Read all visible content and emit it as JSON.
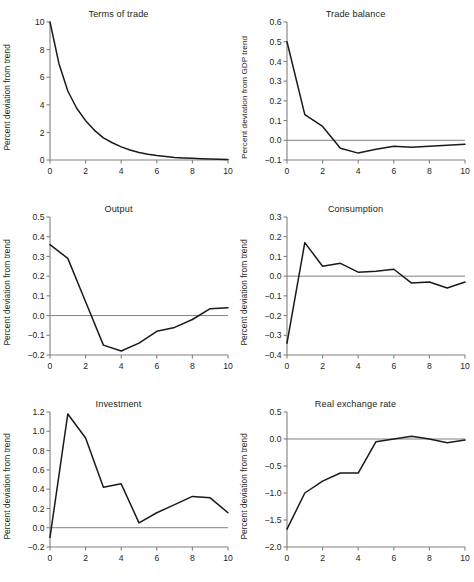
{
  "figure": {
    "panel_count": 6,
    "layout": "3 rows x 2 columns",
    "line_color": "#1a1a1a",
    "axis_color": "#808080",
    "background": "#ffffff"
  },
  "chart_data": [
    {
      "type": "line",
      "title": "Terms of trade",
      "xlabel": "",
      "ylabel": "Percent deviation from trend",
      "x": [
        0,
        0.5,
        1,
        1.5,
        2,
        2.5,
        3,
        3.5,
        4,
        4.5,
        5,
        5.5,
        6,
        6.5,
        7,
        7.5,
        8,
        8.5,
        9,
        9.5,
        10
      ],
      "values": [
        10.0,
        7.0,
        5.0,
        3.75,
        2.85,
        2.15,
        1.6,
        1.25,
        0.95,
        0.72,
        0.55,
        0.42,
        0.32,
        0.25,
        0.19,
        0.15,
        0.12,
        0.09,
        0.07,
        0.05,
        0.04
      ],
      "xlim": [
        0,
        10
      ],
      "ylim": [
        0,
        10
      ],
      "xticks": [
        0,
        2,
        4,
        6,
        8,
        10
      ],
      "yticks": [
        0,
        2,
        4,
        6,
        8,
        10
      ],
      "ytick_labels": [
        "0",
        "2",
        "4",
        "6",
        "8",
        "10"
      ],
      "xtick_labels": [
        "0",
        "2",
        "4",
        "6",
        "8",
        "10"
      ],
      "grid": false,
      "zero_line": false
    },
    {
      "type": "line",
      "title": "Trade balance",
      "xlabel": "",
      "ylabel": "Percent deviation from GDP trend",
      "x": [
        0,
        1,
        2,
        3,
        4,
        5,
        6,
        7,
        8,
        9,
        10
      ],
      "values": [
        0.5,
        0.13,
        0.07,
        -0.04,
        -0.065,
        -0.045,
        -0.03,
        -0.035,
        -0.03,
        -0.025,
        -0.02
      ],
      "xlim": [
        0,
        10
      ],
      "ylim": [
        -0.1,
        0.6
      ],
      "xticks": [
        0,
        2,
        4,
        6,
        8,
        10
      ],
      "yticks": [
        -0.1,
        0.0,
        0.1,
        0.2,
        0.3,
        0.4,
        0.5,
        0.6
      ],
      "ytick_labels": [
        "−0.1",
        "0.0",
        "0.1",
        "0.2",
        "0.3",
        "0.4",
        "0.5",
        "0.6"
      ],
      "xtick_labels": [
        "0",
        "2",
        "4",
        "6",
        "8",
        "10"
      ],
      "grid": false,
      "zero_line": true
    },
    {
      "type": "line",
      "title": "Output",
      "xlabel": "",
      "ylabel": "Percent deviation from trend",
      "x": [
        0,
        1,
        2,
        3,
        4,
        5,
        6,
        7,
        8,
        9,
        10
      ],
      "values": [
        0.36,
        0.29,
        0.07,
        -0.15,
        -0.18,
        -0.14,
        -0.08,
        -0.06,
        -0.02,
        0.035,
        0.04
      ],
      "xlim": [
        0,
        10
      ],
      "ylim": [
        -0.2,
        0.5
      ],
      "xticks": [
        0,
        2,
        4,
        6,
        8,
        10
      ],
      "yticks": [
        -0.2,
        -0.1,
        0.0,
        0.1,
        0.2,
        0.3,
        0.4,
        0.5
      ],
      "ytick_labels": [
        "−0.2",
        "−0.1",
        "0.0",
        "0.1",
        "0.2",
        "0.3",
        "0.4",
        "0.5"
      ],
      "xtick_labels": [
        "0",
        "2",
        "4",
        "6",
        "8",
        "10"
      ],
      "grid": false,
      "zero_line": true
    },
    {
      "type": "line",
      "title": "Consumption",
      "xlabel": "",
      "ylabel": "Percent deviation from trend",
      "x": [
        0,
        1,
        2,
        3,
        4,
        5,
        6,
        7,
        8,
        9,
        10
      ],
      "values": [
        -0.34,
        0.17,
        0.05,
        0.065,
        0.02,
        0.025,
        0.035,
        -0.035,
        -0.03,
        -0.06,
        -0.03
      ],
      "xlim": [
        0,
        10
      ],
      "ylim": [
        -0.4,
        0.3
      ],
      "xticks": [
        0,
        2,
        4,
        6,
        8,
        10
      ],
      "yticks": [
        -0.4,
        -0.3,
        -0.2,
        -0.1,
        0.0,
        0.1,
        0.2,
        0.3
      ],
      "ytick_labels": [
        "−0.4",
        "−0.3",
        "−0.2",
        "−0.1",
        "0.0",
        "0.1",
        "0.2",
        "0.3"
      ],
      "xtick_labels": [
        "0",
        "2",
        "4",
        "6",
        "8",
        "10"
      ],
      "grid": false,
      "zero_line": true
    },
    {
      "type": "line",
      "title": "Investment",
      "xlabel": "",
      "ylabel": "Percent deviation from trend",
      "x": [
        0,
        1,
        2,
        3,
        4,
        5,
        6,
        7,
        8,
        9,
        10
      ],
      "values": [
        -0.1,
        1.18,
        0.93,
        0.42,
        0.455,
        0.05,
        0.155,
        0.24,
        0.325,
        0.31,
        0.155
      ],
      "xlim": [
        0,
        10
      ],
      "ylim": [
        -0.2,
        1.2
      ],
      "xticks": [
        0,
        2,
        4,
        6,
        8,
        10
      ],
      "yticks": [
        -0.2,
        0.0,
        0.2,
        0.4,
        0.6,
        0.8,
        1.0,
        1.2
      ],
      "ytick_labels": [
        "−0.2",
        "0.0",
        "0.2",
        "0.4",
        "0.6",
        "0.8",
        "1.0",
        "1.2"
      ],
      "xtick_labels": [
        "0",
        "2",
        "4",
        "6",
        "8",
        "10"
      ],
      "grid": false,
      "zero_line": true
    },
    {
      "type": "line",
      "title": "Real exchange rate",
      "xlabel": "",
      "ylabel": "Percent deviation from trend",
      "x": [
        0,
        1,
        2,
        3,
        4,
        5,
        6,
        7,
        8,
        9,
        10
      ],
      "values": [
        -1.67,
        -1.0,
        -0.78,
        -0.63,
        -0.63,
        -0.05,
        0.0,
        0.05,
        0.0,
        -0.07,
        -0.02
      ],
      "xlim": [
        0,
        10
      ],
      "ylim": [
        -2.0,
        0.5
      ],
      "xticks": [
        0,
        2,
        4,
        6,
        8,
        10
      ],
      "yticks": [
        -2.0,
        -1.5,
        -1.0,
        -0.5,
        0.0,
        0.5
      ],
      "ytick_labels": [
        "−2.0",
        "−1.5",
        "−1.0",
        "−0.5",
        "0.0",
        "0.5"
      ],
      "xtick_labels": [
        "0",
        "2",
        "4",
        "6",
        "8",
        "10"
      ],
      "grid": false,
      "zero_line": true
    }
  ]
}
